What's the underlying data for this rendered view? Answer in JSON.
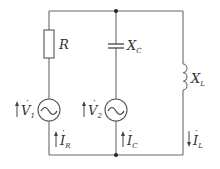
{
  "diagram": {
    "type": "circuit",
    "components": {
      "resistor": {
        "symbol": "R",
        "sub": ""
      },
      "capacitor": {
        "symbol": "X",
        "sub": "C"
      },
      "inductor": {
        "symbol": "X",
        "sub": "L"
      },
      "source1": {
        "symbol": "V",
        "sub": "1",
        "dot": "·"
      },
      "source2": {
        "symbol": "V",
        "sub": "2",
        "dot": "·"
      }
    },
    "currents": {
      "ir": {
        "symbol": "I",
        "sub": "R",
        "dot": "·",
        "direction": "up"
      },
      "ic": {
        "symbol": "I",
        "sub": "C",
        "dot": "·",
        "direction": "up"
      },
      "il": {
        "symbol": "I",
        "sub": "L",
        "dot": "·",
        "direction": "down"
      }
    },
    "colors": {
      "wire": "#6a6a6a",
      "text": "#333333",
      "background": "#ffffff"
    }
  }
}
